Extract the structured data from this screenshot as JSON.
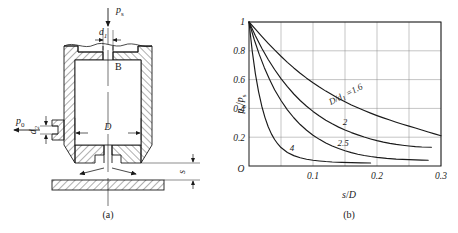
{
  "figure": {
    "panel_a": {
      "caption": "(a)",
      "labels": {
        "supply_pressure": "p",
        "supply_pressure_sub": "s",
        "output_pressure": "p",
        "output_pressure_sub": "0",
        "orifice_diameter": "d",
        "orifice_diameter_sub": "1",
        "side_orifice_diameter": "d",
        "side_orifice_diameter_sub": "2",
        "chamber_diameter": "D",
        "chamber_name": "B",
        "gap": "s"
      }
    },
    "panel_b": {
      "caption": "(b)"
    }
  },
  "chart_data": {
    "type": "line",
    "title": "",
    "xlabel": "s/D",
    "ylabel": "p0/ps",
    "ylabel_parts": {
      "num": "p",
      "num_sub": "0",
      "den": "p",
      "den_sub": "s"
    },
    "xlabel_parts": {
      "num": "s",
      "den": "D"
    },
    "origin_label": "O",
    "xlim": [
      0,
      0.3
    ],
    "ylim": [
      0,
      1
    ],
    "xticks": [
      0.1,
      0.2,
      0.3
    ],
    "xticklabels": [
      "0.1",
      "0.2",
      "0.3"
    ],
    "yticks": [
      0.2,
      0.4,
      0.6,
      0.8,
      1
    ],
    "yticklabels": [
      "0.2",
      "0.4",
      "0.6",
      "0.8",
      "1"
    ],
    "grid": true,
    "grid_x_step": 0.05,
    "grid_y_step": 0.2,
    "legend_position": "inline-on-curve",
    "series": [
      {
        "name": "D/d1 = 1.6",
        "label": "=1.6",
        "label_prefix": "D/d",
        "label_prefix_sub": "1",
        "points": [
          [
            0.0,
            1.0
          ],
          [
            0.01,
            0.95
          ],
          [
            0.02,
            0.9
          ],
          [
            0.03,
            0.852
          ],
          [
            0.04,
            0.806
          ],
          [
            0.05,
            0.762
          ],
          [
            0.06,
            0.72
          ],
          [
            0.07,
            0.681
          ],
          [
            0.08,
            0.644
          ],
          [
            0.09,
            0.61
          ],
          [
            0.1,
            0.578
          ],
          [
            0.11,
            0.548
          ],
          [
            0.12,
            0.52
          ],
          [
            0.13,
            0.494
          ],
          [
            0.14,
            0.469
          ],
          [
            0.15,
            0.446
          ],
          [
            0.16,
            0.424
          ],
          [
            0.17,
            0.404
          ],
          [
            0.18,
            0.385
          ],
          [
            0.19,
            0.367
          ],
          [
            0.2,
            0.35
          ],
          [
            0.21,
            0.334
          ],
          [
            0.22,
            0.319
          ],
          [
            0.23,
            0.304
          ],
          [
            0.24,
            0.29
          ],
          [
            0.25,
            0.277
          ],
          [
            0.26,
            0.264
          ],
          [
            0.27,
            0.25
          ],
          [
            0.28,
            0.236
          ],
          [
            0.29,
            0.223
          ],
          [
            0.3,
            0.21
          ]
        ]
      },
      {
        "name": "D/d1 = 2",
        "label": "2",
        "points": [
          [
            0.0,
            1.0
          ],
          [
            0.01,
            0.905
          ],
          [
            0.02,
            0.818
          ],
          [
            0.03,
            0.74
          ],
          [
            0.04,
            0.67
          ],
          [
            0.05,
            0.607
          ],
          [
            0.06,
            0.551
          ],
          [
            0.07,
            0.5
          ],
          [
            0.08,
            0.455
          ],
          [
            0.09,
            0.415
          ],
          [
            0.1,
            0.379
          ],
          [
            0.11,
            0.347
          ],
          [
            0.12,
            0.318
          ],
          [
            0.13,
            0.293
          ],
          [
            0.14,
            0.27
          ],
          [
            0.15,
            0.25
          ],
          [
            0.16,
            0.232
          ],
          [
            0.17,
            0.216
          ],
          [
            0.18,
            0.201
          ],
          [
            0.19,
            0.188
          ],
          [
            0.2,
            0.176
          ],
          [
            0.21,
            0.166
          ],
          [
            0.22,
            0.157
          ],
          [
            0.23,
            0.15
          ],
          [
            0.24,
            0.144
          ],
          [
            0.25,
            0.139
          ],
          [
            0.26,
            0.135
          ],
          [
            0.27,
            0.132
          ],
          [
            0.285,
            0.13
          ]
        ]
      },
      {
        "name": "D/d1 = 2.5",
        "label": "2.5",
        "points": [
          [
            0.0,
            1.0
          ],
          [
            0.008,
            0.88
          ],
          [
            0.016,
            0.775
          ],
          [
            0.024,
            0.683
          ],
          [
            0.032,
            0.602
          ],
          [
            0.04,
            0.53
          ],
          [
            0.05,
            0.455
          ],
          [
            0.06,
            0.39
          ],
          [
            0.07,
            0.335
          ],
          [
            0.08,
            0.288
          ],
          [
            0.09,
            0.248
          ],
          [
            0.1,
            0.214
          ],
          [
            0.11,
            0.185
          ],
          [
            0.12,
            0.16
          ],
          [
            0.13,
            0.139
          ],
          [
            0.14,
            0.121
          ],
          [
            0.15,
            0.106
          ],
          [
            0.16,
            0.093
          ],
          [
            0.17,
            0.082
          ],
          [
            0.18,
            0.073
          ],
          [
            0.19,
            0.066
          ],
          [
            0.2,
            0.06
          ],
          [
            0.215,
            0.053
          ],
          [
            0.23,
            0.048
          ],
          [
            0.25,
            0.044
          ],
          [
            0.27,
            0.041
          ],
          [
            0.28,
            0.04
          ]
        ]
      },
      {
        "name": "D/d1 = 4",
        "label": "4",
        "points": [
          [
            0.0,
            1.0
          ],
          [
            0.005,
            0.8
          ],
          [
            0.01,
            0.64
          ],
          [
            0.015,
            0.515
          ],
          [
            0.02,
            0.415
          ],
          [
            0.025,
            0.336
          ],
          [
            0.03,
            0.273
          ],
          [
            0.035,
            0.223
          ],
          [
            0.04,
            0.184
          ],
          [
            0.045,
            0.153
          ],
          [
            0.05,
            0.128
          ],
          [
            0.06,
            0.094
          ],
          [
            0.07,
            0.072
          ],
          [
            0.08,
            0.057
          ],
          [
            0.09,
            0.047
          ],
          [
            0.1,
            0.04
          ],
          [
            0.11,
            0.035
          ],
          [
            0.12,
            0.031
          ],
          [
            0.13,
            0.028
          ],
          [
            0.145,
            0.025
          ],
          [
            0.16,
            0.023
          ],
          [
            0.175,
            0.022
          ],
          [
            0.19,
            0.021
          ]
        ]
      }
    ]
  }
}
